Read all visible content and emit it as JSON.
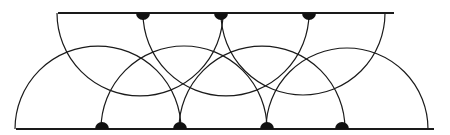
{
  "diagram": {
    "colors": {
      "stroke": "#1a1a1a",
      "dot": "#111111",
      "background": "#ffffff"
    },
    "top_line": {
      "x1": 58,
      "x2": 394,
      "y": 13
    },
    "bottom_line": {
      "x1": 16,
      "x2": 434,
      "y": 129
    },
    "top_arcs": [
      {
        "cx": 140,
        "r": 83
      },
      {
        "cx": 226,
        "r": 83
      },
      {
        "cx": 303,
        "r": 82
      }
    ],
    "bottom_arcs": [
      {
        "cx": 98,
        "r": 83
      },
      {
        "cx": 184,
        "r": 83
      },
      {
        "cx": 262,
        "r": 83
      },
      {
        "cx": 347,
        "r": 81
      }
    ],
    "top_dots": [
      143,
      221,
      309
    ],
    "bottom_dots": [
      102,
      180,
      267,
      342
    ],
    "dot_radius": 7
  }
}
